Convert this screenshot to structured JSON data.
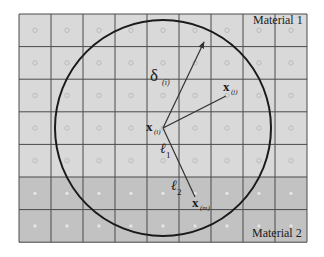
{
  "figure": {
    "type": "peridynamic-horizon-diagram",
    "grid": {
      "left": 19,
      "top": 14,
      "cols": 9,
      "rows": 7,
      "cell_w": 32,
      "cell_h": 32.6,
      "material1_rows": 5,
      "material2_rows": 2
    },
    "colors": {
      "material1_fill": "#d9d9d9",
      "material2_fill": "#c2c2c2",
      "grid_line": "#4a4a4a",
      "circle": "#1a1a1a",
      "arrow": "#333333",
      "node_m1": "#bcbcbc",
      "node_m2": "#e6e6e6"
    },
    "circle": {
      "cx": 163,
      "cy": 128,
      "r": 108
    },
    "labels": {
      "material1": "Material 1",
      "material2": "Material 2",
      "delta_main": "δ",
      "delta_sub": "(i)",
      "x_i_main": "x",
      "x_i_sub": "(i)",
      "x_j_main": "x",
      "x_j_sub": "(j)",
      "x_m_main": "x",
      "x_m_sub": "(m)",
      "l1_main": "ℓ",
      "l1_sub": "1",
      "l2_main": "ℓ",
      "l2_sub": "2"
    }
  }
}
